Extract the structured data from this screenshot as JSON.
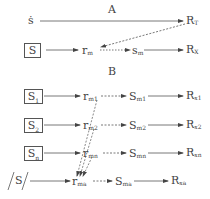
{
  "sections": {
    "A": {
      "title": "A",
      "top_row": {
        "source": "ṡ",
        "target_base": "R",
        "target_sub": "T"
      },
      "bottom_row": {
        "source": "S",
        "node1_base": "r",
        "node1_sub": "m",
        "node2_base": "s",
        "node2_sub": "m",
        "target_base": "R",
        "target_sub": "X"
      }
    },
    "B": {
      "title": "B",
      "rows": [
        {
          "source_base": "S",
          "source_sub": "1",
          "r_base": "r",
          "r_sub": "m1",
          "s_base": "S",
          "s_sub": "m1",
          "R_base": "R",
          "R_sub": "x1"
        },
        {
          "source_base": "S",
          "source_sub": "2",
          "r_base": "r",
          "r_sub": "m2",
          "s_base": "S",
          "s_sub": "m2",
          "R_base": "R",
          "R_sub": "x2"
        },
        {
          "source_base": "S",
          "source_sub": "n",
          "r_base": "r",
          "r_sub": "mn",
          "s_base": "S",
          "s_sub": "mn",
          "R_base": "R",
          "R_sub": "xn"
        },
        {
          "source_base": "/S/",
          "source_sub": "",
          "r_base": "r",
          "r_sub": "ma",
          "s_base": "S",
          "s_sub": "ma",
          "R_base": "R",
          "R_sub": "xa"
        }
      ]
    }
  },
  "colors": {
    "line": "#555555",
    "text": "#444444"
  }
}
